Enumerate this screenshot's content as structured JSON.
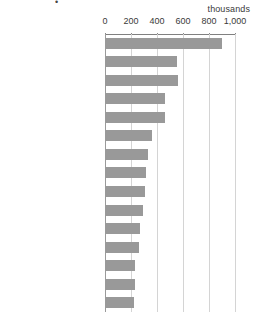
{
  "chart": {
    "title_remnant": "•",
    "unit_label": "thousands"
  },
  "chart_data": {
    "type": "bar",
    "orientation": "horizontal",
    "title": "",
    "subtitle": "",
    "xlabel": "thousands",
    "ylabel": "",
    "xlim": [
      0,
      1000
    ],
    "ylim": null,
    "grid": true,
    "legend": false,
    "legend_position": "none",
    "bar_color": "#999999",
    "gridline_color": "#d4d4d4",
    "axis_color": "#808080",
    "tick_labels": [
      "0",
      "200",
      "400",
      "600",
      "800",
      "1,000"
    ],
    "ticks": [
      0,
      200,
      400,
      600,
      800,
      1000
    ],
    "categories": [
      "Edinburgh",
      "Manchester",
      "Birmingham",
      "Glasgow",
      "Oxford",
      "Cambridge",
      "Bristol",
      "York",
      "Bath",
      "Brighton / Hove",
      "Cardiff",
      "Inverness",
      "Liverpool",
      "Nottingham",
      "Newcastle-upon-Tyne"
    ],
    "values": [
      900,
      553,
      561,
      462,
      460,
      360,
      330,
      315,
      308,
      290,
      270,
      262,
      230,
      228,
      225
    ]
  }
}
